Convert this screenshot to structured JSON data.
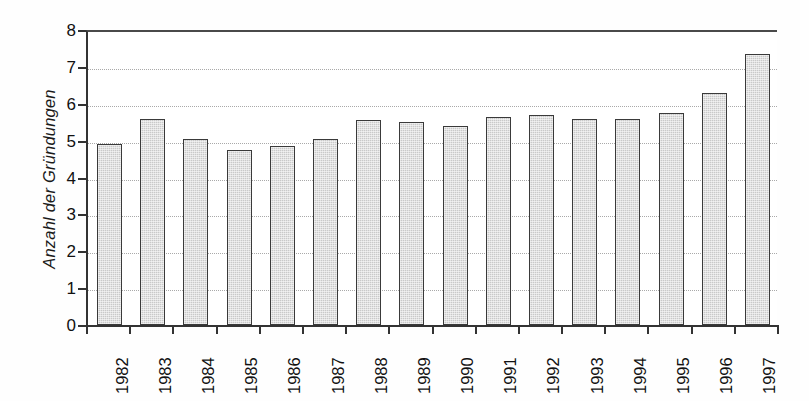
{
  "chart_data": {
    "type": "bar",
    "title": "",
    "xlabel": "",
    "ylabel": "Anzahl der Gründungen",
    "categories": [
      "1982",
      "1983",
      "1984",
      "1985",
      "1986",
      "1987",
      "1988",
      "1989",
      "1990",
      "1991",
      "1992",
      "1993",
      "1994",
      "1995",
      "1996",
      "1997"
    ],
    "values": [
      4.9,
      5.6,
      5.05,
      4.75,
      4.85,
      5.05,
      5.55,
      5.5,
      5.4,
      5.65,
      5.7,
      5.6,
      5.6,
      5.75,
      6.3,
      7.35
    ],
    "ylim": [
      0,
      8
    ],
    "yticks": [
      0,
      1,
      2,
      3,
      4,
      5,
      6,
      7,
      8
    ],
    "ytick_labels": [
      "0",
      "1",
      "2",
      "3",
      "4",
      "5",
      "6",
      "7",
      "8"
    ],
    "grid": true,
    "grid_axis": "y",
    "grid_style": "dotted",
    "legend": null,
    "legend_position": "none",
    "xtick_rotation": 90,
    "ylabel_style": "italic",
    "bar_fill_color": "#c9c9c9",
    "bar_edge_color": "#3a3a3a",
    "background_color": "#ffffff",
    "axis_color": "#333333",
    "gridline_color": "#a9a9a9"
  },
  "axes": {
    "y_title": "Anzahl der Gründungen"
  }
}
